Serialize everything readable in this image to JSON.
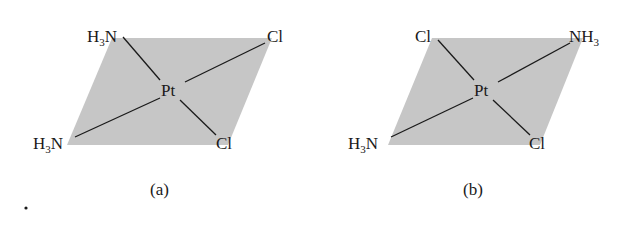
{
  "figure": {
    "panel_a": {
      "caption": "(a)",
      "center": "Pt",
      "top_left": {
        "main": "H",
        "sub": "3",
        "tail": "N"
      },
      "top_right": "Cl",
      "bottom_left": {
        "main": "H",
        "sub": "3",
        "tail": "N"
      },
      "bottom_right": "Cl"
    },
    "panel_b": {
      "caption": "(b)",
      "center": "Pt",
      "top_left": "Cl",
      "top_right": {
        "main": "NH",
        "sub": "3"
      },
      "bottom_left": {
        "main": "H",
        "sub": "3",
        "tail": "N"
      },
      "bottom_right": "Cl"
    },
    "colors": {
      "plane": "#c4c4c4",
      "bond": "#1a1a1a",
      "text": "#1a1a1a"
    }
  }
}
